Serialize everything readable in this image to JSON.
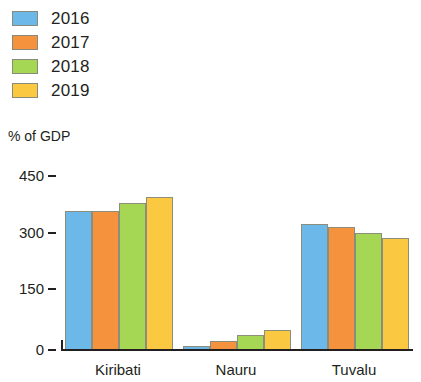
{
  "legend": {
    "position": "top-left",
    "entries": [
      {
        "label": "2016",
        "color": "#6CB8E8"
      },
      {
        "label": "2017",
        "color": "#F5923E"
      },
      {
        "label": "2018",
        "color": "#A5D755"
      },
      {
        "label": "2019",
        "color": "#FBC941"
      }
    ]
  },
  "axis": {
    "y_title": "% of GDP",
    "ticks": [
      "450",
      "300",
      "150",
      "0"
    ]
  },
  "categories": [
    "Kiribati",
    "Nauru",
    "Tuvalu"
  ],
  "chart_data": {
    "type": "bar",
    "title": "",
    "subtitle": "",
    "xlabel": "",
    "ylabel": "% of GDP",
    "ylim": [
      0,
      450
    ],
    "yticks": [
      0,
      150,
      300,
      450
    ],
    "grid": false,
    "legend_position": "top-left",
    "categories": [
      "Kiribati",
      "Nauru",
      "Tuvalu"
    ],
    "series": [
      {
        "name": "2016",
        "color": "#6CB8E8",
        "values": [
          358,
          8,
          323
        ]
      },
      {
        "name": "2017",
        "color": "#F5923E",
        "values": [
          358,
          21,
          315
        ]
      },
      {
        "name": "2018",
        "color": "#A5D755",
        "values": [
          378,
          36,
          300
        ]
      },
      {
        "name": "2019",
        "color": "#FBC941",
        "values": [
          393,
          49,
          287
        ]
      }
    ]
  }
}
